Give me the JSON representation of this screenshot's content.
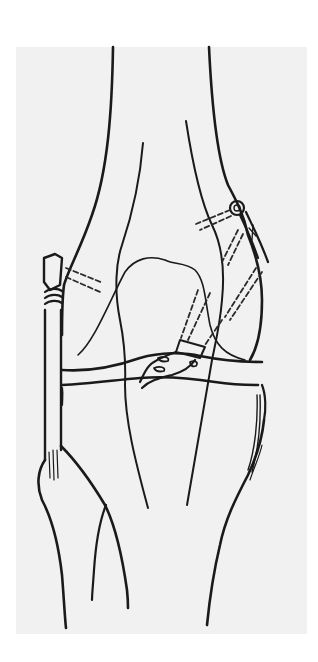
{
  "figure": {
    "colors": {
      "page_background": "#ffffff",
      "panel_background": "#f1f1f1",
      "line": "#1a1a1a"
    },
    "elements": [
      "femur-outline",
      "tibia-outline",
      "fibula-outline",
      "patella-outline",
      "joint-line",
      "lateral-screw-washer",
      "medial-screw-washer",
      "tunnel-screw-paths",
      "graft-intercondylar",
      "medial-staple",
      "lateral-graft-wrap"
    ]
  }
}
